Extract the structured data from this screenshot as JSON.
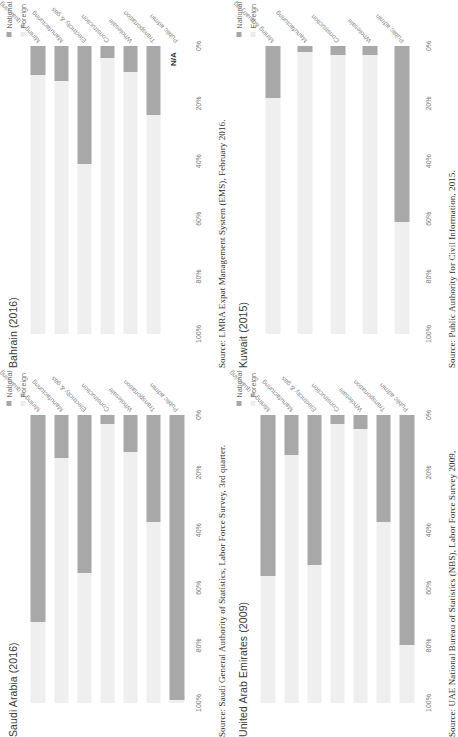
{
  "legend": {
    "national_label": "National",
    "foreign_label": "Foreign",
    "national_color": "#a8a8a8",
    "foreign_color": "#efefef"
  },
  "axis": {
    "ticks": [
      "100%",
      "80%",
      "60%",
      "40%",
      "20%",
      "0%"
    ],
    "ylim": [
      0,
      100
    ],
    "ylabel": "",
    "xlabel": ""
  },
  "na_text": "N/A",
  "panels": [
    {
      "title": "Kuwait (2015)",
      "source": "Source: Public Authority for Civil Information, 2015."
    },
    {
      "title": "United Arab Emirates (2009)",
      "source": "Source: UAE National Bureau of Statistics (NBS), Labor Force Survey 2009,"
    },
    {
      "title": "Bahrain (2016)",
      "source": "Source: LMRA Expat Management System (EMS), February 2016."
    },
    {
      "title": "Saudi Arabia (2016)",
      "source": "Source: Saudi General Authority of Statistics, Labor Force Survey, 3rd quarter."
    }
  ],
  "chart_data": [
    {
      "type": "bar",
      "title": "Kuwait (2015)",
      "subtitle": "",
      "stacked": true,
      "orientation": "horizontal",
      "categories": [
        "Mining & quarrying",
        "Manufacturing",
        "Construction",
        "Wholesale",
        "Public admin"
      ],
      "series": [
        {
          "name": "National",
          "values": [
            18,
            2,
            3,
            3,
            61
          ]
        },
        {
          "name": "Foreign",
          "values": [
            82,
            98,
            97,
            97,
            39
          ]
        }
      ],
      "xlabel": "",
      "ylabel": "",
      "ylim": [
        0,
        100
      ],
      "grid": false,
      "legend_position": "top-right",
      "source": "Source: Public Authority for Civil Information, 2015."
    },
    {
      "type": "bar",
      "title": "United Arab Emirates (2009)",
      "subtitle": "",
      "stacked": true,
      "orientation": "horizontal",
      "categories": [
        "Mining & quarrying",
        "Manufacturing",
        "Electricity & gas",
        "Construction",
        "Wholesale",
        "Transportation",
        "Public admin"
      ],
      "series": [
        {
          "name": "National",
          "values": [
            56,
            14,
            52,
            3,
            5,
            37,
            80
          ]
        },
        {
          "name": "Foreign",
          "values": [
            44,
            86,
            48,
            97,
            95,
            63,
            20
          ]
        }
      ],
      "xlabel": "",
      "ylabel": "",
      "ylim": [
        0,
        100
      ],
      "grid": false,
      "legend_position": "top-right",
      "source": "Source: UAE National Bureau of Statistics (NBS), Labor Force Survey 2009,"
    },
    {
      "type": "bar",
      "title": "Bahrain (2016)",
      "subtitle": "",
      "stacked": true,
      "orientation": "horizontal",
      "categories": [
        "Mining & quarrying",
        "Manufacturing",
        "Electricity & gas",
        "Construction",
        "Wholesale",
        "Transportation",
        "Public admin"
      ],
      "series": [
        {
          "name": "National",
          "values": [
            10,
            12,
            41,
            4,
            9,
            24,
            null
          ]
        },
        {
          "name": "Foreign",
          "values": [
            90,
            88,
            59,
            96,
            91,
            76,
            null
          ]
        }
      ],
      "annotations": [
        {
          "category": "Public admin",
          "text": "N/A"
        }
      ],
      "xlabel": "",
      "ylabel": "",
      "ylim": [
        0,
        100
      ],
      "grid": false,
      "legend_position": "top-right",
      "source": "Source: LMRA Expat Management System (EMS), February 2016."
    },
    {
      "type": "bar",
      "title": "Saudi Arabia (2016)",
      "subtitle": "",
      "stacked": true,
      "orientation": "horizontal",
      "categories": [
        "Mining & quarrying",
        "Manufacturing",
        "Electricity & gas",
        "Construction",
        "Wholesale",
        "Transportation",
        "Public admin"
      ],
      "series": [
        {
          "name": "National",
          "values": [
            72,
            15,
            55,
            3,
            13,
            37,
            99
          ]
        },
        {
          "name": "Foreign",
          "values": [
            28,
            85,
            45,
            97,
            87,
            63,
            1
          ]
        }
      ],
      "xlabel": "",
      "ylabel": "",
      "ylim": [
        0,
        100
      ],
      "grid": false,
      "legend_position": "top-right",
      "source": "Source: Saudi General Authority of Statistics, Labor Force Survey, 3rd quarter."
    }
  ]
}
